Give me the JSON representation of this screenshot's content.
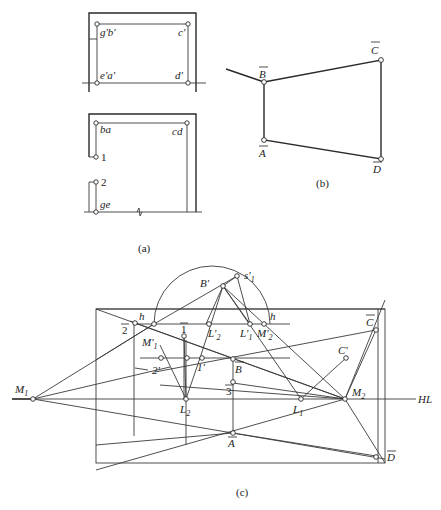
{
  "panel_a": {
    "caption": "(a)",
    "labels": {
      "gb": "g'b'",
      "c": "c'",
      "ea": "e'a'",
      "d": "d'",
      "ba": "ba",
      "cd": "cd",
      "p1": "1",
      "p2": "2",
      "ge": "ge"
    }
  },
  "panel_b": {
    "caption": "(b)",
    "labels": {
      "B": "B",
      "C": "C",
      "A": "A",
      "D": "D"
    }
  },
  "panel_c": {
    "caption": "(c)",
    "labels": {
      "Bp": "B'",
      "s1": "s'",
      "s1sub": "1",
      "h_left": "h",
      "h_right": "h",
      "L2p": "L'",
      "L2psub": "2",
      "L1p": "L'",
      "L1psub": "1",
      "M2p": "M'",
      "M2psub": "2",
      "M1p": "M'",
      "M1psub": "1",
      "bar1": "1",
      "bar2": "2",
      "bar3": "3",
      "one_p": "1'",
      "two_p": "2'",
      "B": "B",
      "C": "C",
      "Cp": "C'",
      "A": "A",
      "D": "D",
      "M1": "M",
      "M1sub": "1",
      "M2": "M",
      "M2sub": "2",
      "L1": "L",
      "L1sub": "1",
      "L2": "L",
      "L2sub": "2",
      "HL": "HL"
    }
  }
}
